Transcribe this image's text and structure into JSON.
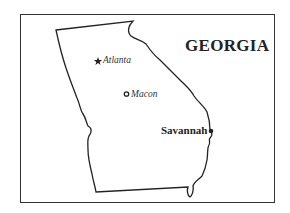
{
  "map": {
    "title": "GEORGIA",
    "cities": [
      {
        "name": "Atlanta",
        "symbol": "star",
        "label_style": "italic"
      },
      {
        "name": "Macon",
        "symbol": "open-circle",
        "label_style": "italic"
      },
      {
        "name": "Savannah",
        "symbol": "filled-dot",
        "label_style": "bold"
      }
    ],
    "colors": {
      "outline": "#222222",
      "background": "#ffffff"
    }
  }
}
